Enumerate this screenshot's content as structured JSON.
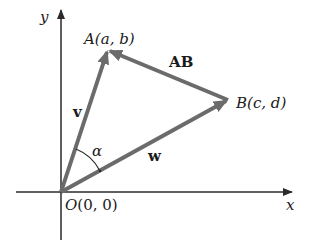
{
  "diagram": {
    "axes": {
      "x_label": "x",
      "y_label": "y",
      "origin_label_prefix": "O",
      "origin_label_coords": "(0, 0)"
    },
    "points": {
      "A": {
        "name": "A",
        "coords": "(a, b)"
      },
      "B": {
        "name": "B",
        "coords": "(c, d)"
      }
    },
    "vectors": {
      "v": {
        "label": "v",
        "from": "O",
        "to": "A"
      },
      "w": {
        "label": "w",
        "from": "O",
        "to": "B"
      },
      "AB": {
        "label": "AB",
        "from": "B",
        "to": "A"
      }
    },
    "angle": {
      "label": "α",
      "between": [
        "v",
        "w"
      ]
    },
    "colors": {
      "vector": "#6b6b6b",
      "axis": "#2a2a2a",
      "text": "#1a1a1a"
    }
  }
}
